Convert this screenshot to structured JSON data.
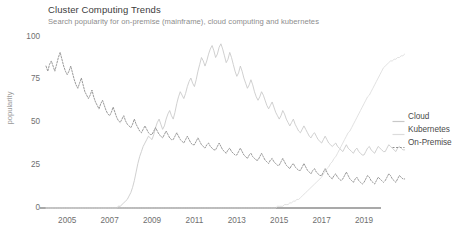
{
  "chart_data": {
    "type": "line",
    "title": "Cluster Computing Trends",
    "subtitle": "Search popularity for on-premise (mainframe), cloud computing and kubernetes",
    "xlabel": "",
    "ylabel": "popularity",
    "xlim": [
      2004.0,
      2019.8
    ],
    "ylim": [
      0,
      100
    ],
    "grid": false,
    "legend_position": "right",
    "xticks": [
      "2005",
      "2007",
      "2009",
      "2011",
      "2013",
      "2015",
      "2017",
      "2019"
    ],
    "xtick_values": [
      2005,
      2007,
      2009,
      2011,
      2013,
      2015,
      2017,
      2019
    ],
    "yticks": [
      "0",
      "25",
      "50",
      "75",
      "100"
    ],
    "ytick_values": [
      0,
      25,
      50,
      75,
      100
    ],
    "x_start": 2004.0,
    "x_step": 0.08333,
    "series": [
      {
        "name": "Cloud",
        "color": "#c8c8c8",
        "style": "solid",
        "values": [
          0,
          0,
          0,
          0,
          0,
          0,
          0,
          0,
          0,
          0,
          0,
          0,
          0,
          0,
          0,
          0,
          0,
          0,
          0,
          0,
          0,
          0,
          0,
          0,
          0,
          0,
          0,
          0,
          0,
          0,
          0,
          0,
          0,
          0,
          0,
          0,
          0,
          0,
          0,
          0,
          0,
          1,
          1,
          2,
          3,
          4,
          5,
          7,
          9,
          12,
          16,
          21,
          26,
          30,
          33,
          36,
          38,
          40,
          42,
          41,
          40,
          43,
          47,
          50,
          52,
          49,
          46,
          48,
          52,
          55,
          57,
          54,
          52,
          56,
          61,
          65,
          68,
          66,
          64,
          67,
          71,
          74,
          76,
          73,
          71,
          75,
          80,
          84,
          88,
          86,
          83,
          86,
          90,
          93,
          95,
          92,
          88,
          90,
          94,
          96,
          93,
          89,
          85,
          87,
          91,
          88,
          84,
          80,
          77,
          79,
          83,
          80,
          76,
          73,
          70,
          72,
          75,
          72,
          68,
          65,
          63,
          65,
          68,
          66,
          63,
          60,
          58,
          60,
          62,
          59,
          56,
          54,
          52,
          54,
          57,
          55,
          52,
          50,
          48,
          50,
          52,
          49,
          47,
          45,
          44,
          46,
          48,
          46,
          44,
          42,
          41,
          43,
          44,
          42,
          40,
          39,
          38,
          40,
          42,
          40,
          38,
          37,
          36,
          37,
          38,
          36,
          35,
          34,
          33,
          35,
          37,
          35,
          34,
          33,
          32,
          34,
          35,
          33,
          32,
          31,
          31,
          33,
          35,
          36,
          34,
          33,
          32,
          34,
          36,
          35,
          34,
          33,
          33,
          35,
          37,
          36,
          35,
          34,
          33,
          35,
          36,
          35,
          34,
          34
        ]
      },
      {
        "name": "Kubernetes",
        "color": "#dcdcdc",
        "style": "solid",
        "values": [
          0,
          0,
          0,
          0,
          0,
          0,
          0,
          0,
          0,
          0,
          0,
          0,
          0,
          0,
          0,
          0,
          0,
          0,
          0,
          0,
          0,
          0,
          0,
          0,
          0,
          0,
          0,
          0,
          0,
          0,
          0,
          0,
          0,
          0,
          0,
          0,
          0,
          0,
          0,
          0,
          0,
          0,
          0,
          0,
          0,
          0,
          0,
          0,
          0,
          0,
          0,
          0,
          0,
          0,
          0,
          0,
          0,
          0,
          0,
          0,
          0,
          0,
          0,
          0,
          0,
          0,
          0,
          0,
          0,
          0,
          0,
          0,
          0,
          0,
          0,
          0,
          0,
          0,
          0,
          0,
          0,
          0,
          0,
          0,
          0,
          0,
          0,
          0,
          0,
          0,
          0,
          0,
          0,
          0,
          0,
          0,
          0,
          0,
          0,
          0,
          0,
          0,
          0,
          0,
          0,
          0,
          0,
          0,
          0,
          0,
          0,
          0,
          0,
          0,
          0,
          0,
          0,
          0,
          0,
          0,
          0,
          0,
          0,
          0,
          0,
          0,
          0,
          0,
          0,
          0,
          0,
          1,
          1,
          1,
          1,
          2,
          2,
          2,
          3,
          3,
          4,
          4,
          5,
          5,
          6,
          7,
          8,
          9,
          10,
          11,
          12,
          13,
          14,
          15,
          16,
          17,
          18,
          20,
          21,
          23,
          24,
          26,
          27,
          29,
          30,
          32,
          34,
          36,
          38,
          40,
          42,
          44,
          45,
          47,
          49,
          51,
          53,
          55,
          57,
          59,
          61,
          63,
          65,
          66,
          68,
          70,
          72,
          74,
          76,
          78,
          80,
          82,
          83,
          84,
          85,
          86,
          86,
          87,
          87,
          88,
          88,
          89,
          89,
          90
        ]
      },
      {
        "name": "On-Premise",
        "color": "#8f8f8f",
        "style": "dashed",
        "values": [
          83,
          80,
          84,
          86,
          83,
          80,
          84,
          88,
          91,
          87,
          83,
          80,
          78,
          80,
          83,
          79,
          75,
          72,
          70,
          73,
          76,
          72,
          68,
          66,
          64,
          66,
          69,
          65,
          62,
          60,
          58,
          61,
          63,
          60,
          57,
          55,
          54,
          56,
          59,
          56,
          53,
          51,
          50,
          52,
          54,
          51,
          49,
          48,
          47,
          49,
          52,
          49,
          47,
          45,
          44,
          46,
          48,
          46,
          44,
          43,
          43,
          45,
          47,
          45,
          43,
          42,
          41,
          43,
          45,
          43,
          41,
          40,
          40,
          42,
          44,
          42,
          40,
          39,
          38,
          40,
          42,
          40,
          38,
          37,
          37,
          39,
          41,
          39,
          37,
          36,
          35,
          37,
          38,
          36,
          35,
          34,
          34,
          36,
          38,
          36,
          34,
          33,
          32,
          34,
          35,
          33,
          32,
          31,
          31,
          33,
          35,
          33,
          31,
          30,
          29,
          31,
          32,
          30,
          29,
          28,
          28,
          30,
          32,
          30,
          28,
          27,
          26,
          28,
          29,
          27,
          26,
          25,
          25,
          27,
          29,
          27,
          25,
          24,
          23,
          25,
          26,
          24,
          23,
          22,
          22,
          24,
          26,
          24,
          22,
          21,
          20,
          22,
          23,
          21,
          20,
          19,
          19,
          21,
          23,
          21,
          19,
          18,
          17,
          19,
          20,
          18,
          17,
          16,
          17,
          19,
          21,
          19,
          17,
          16,
          15,
          17,
          18,
          16,
          15,
          14,
          15,
          17,
          19,
          18,
          16,
          15,
          14,
          16,
          18,
          17,
          16,
          15,
          16,
          18,
          20,
          19,
          17,
          16,
          15,
          17,
          19,
          18,
          17,
          17
        ]
      }
    ]
  }
}
